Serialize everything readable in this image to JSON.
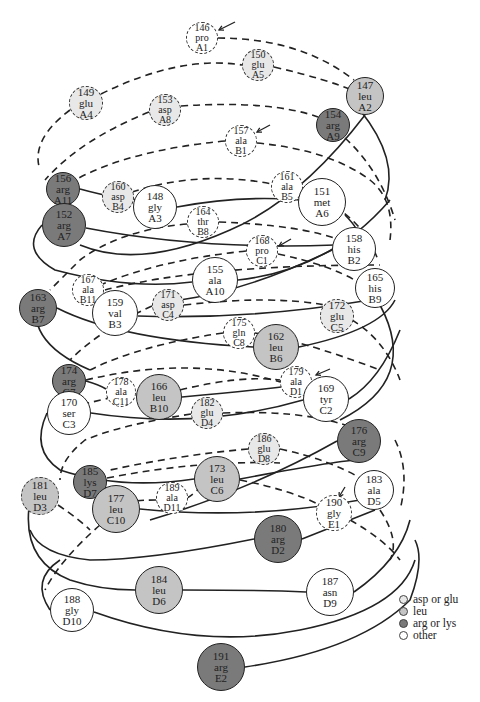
{
  "colors": {
    "asp_or_glu": "#e8e8e8",
    "leu": "#c4c4c4",
    "arg_or_lys": "#7a7a7a",
    "other": "#ffffff"
  },
  "legend": [
    {
      "label": "asp or glu",
      "category": "asp_or_glu"
    },
    {
      "label": "leu",
      "category": "leu"
    },
    {
      "label": "arg or lys",
      "category": "arg_or_lys"
    },
    {
      "label": "other",
      "category": "other"
    }
  ],
  "residues": [
    {
      "num": "146",
      "aa": "pro",
      "pos": "A1",
      "cat": "other",
      "x": 202,
      "y": 38,
      "r": 16,
      "dashed": true
    },
    {
      "num": "150",
      "aa": "glu",
      "pos": "A5",
      "cat": "asp_or_glu",
      "x": 258,
      "y": 65,
      "r": 16,
      "dashed": true
    },
    {
      "num": "147",
      "aa": "leu",
      "pos": "A2",
      "cat": "leu",
      "x": 365,
      "y": 96,
      "r": 19,
      "dashed": false
    },
    {
      "num": "149",
      "aa": "glu",
      "pos": "A4",
      "cat": "asp_or_glu",
      "x": 86,
      "y": 103,
      "r": 17,
      "dashed": true
    },
    {
      "num": "153",
      "aa": "asp",
      "pos": "A8",
      "cat": "asp_or_glu",
      "x": 165,
      "y": 110,
      "r": 16,
      "dashed": true
    },
    {
      "num": "154",
      "aa": "arg",
      "pos": "A9",
      "cat": "arg_or_lys",
      "x": 333,
      "y": 125,
      "r": 17,
      "dashed": false
    },
    {
      "num": "157",
      "aa": "ala",
      "pos": "B1",
      "cat": "other",
      "x": 241,
      "y": 141,
      "r": 16,
      "dashed": true
    },
    {
      "num": "156",
      "aa": "arg",
      "pos": "A11",
      "cat": "arg_or_lys",
      "x": 63,
      "y": 189,
      "r": 17,
      "dashed": false
    },
    {
      "num": "160",
      "aa": "asp",
      "pos": "B4",
      "cat": "asp_or_glu",
      "x": 118,
      "y": 197,
      "r": 16,
      "dashed": true
    },
    {
      "num": "148",
      "aa": "gly",
      "pos": "A3",
      "cat": "other",
      "x": 155,
      "y": 207,
      "r": 22,
      "dashed": false
    },
    {
      "num": "161",
      "aa": "ala",
      "pos": "B5",
      "cat": "other",
      "x": 287,
      "y": 187,
      "r": 16,
      "dashed": true
    },
    {
      "num": "151",
      "aa": "met",
      "pos": "A6",
      "cat": "other",
      "x": 322,
      "y": 202,
      "r": 24,
      "dashed": false
    },
    {
      "num": "152",
      "aa": "arg",
      "pos": "A7",
      "cat": "arg_or_lys",
      "x": 64,
      "y": 225,
      "r": 22,
      "dashed": false
    },
    {
      "num": "164",
      "aa": "thr",
      "pos": "B8",
      "cat": "other",
      "x": 203,
      "y": 222,
      "r": 16,
      "dashed": true
    },
    {
      "num": "168",
      "aa": "pro",
      "pos": "C1",
      "cat": "other",
      "x": 262,
      "y": 251,
      "r": 16,
      "dashed": true
    },
    {
      "num": "158",
      "aa": "his",
      "pos": "B2",
      "cat": "other",
      "x": 354,
      "y": 249,
      "r": 22,
      "dashed": false
    },
    {
      "num": "155",
      "aa": "ala",
      "pos": "A10",
      "cat": "other",
      "x": 215,
      "y": 280,
      "r": 23,
      "dashed": false
    },
    {
      "num": "165",
      "aa": "his",
      "pos": "B9",
      "cat": "other",
      "x": 375,
      "y": 288,
      "r": 20,
      "dashed": false
    },
    {
      "num": "167",
      "aa": "ala",
      "pos": "B11",
      "cat": "other",
      "x": 88,
      "y": 290,
      "r": 16,
      "dashed": true
    },
    {
      "num": "163",
      "aa": "arg",
      "pos": "B7",
      "cat": "arg_or_lys",
      "x": 38,
      "y": 308,
      "r": 19,
      "dashed": false
    },
    {
      "num": "159",
      "aa": "val",
      "pos": "B3",
      "cat": "other",
      "x": 115,
      "y": 313,
      "r": 23,
      "dashed": false
    },
    {
      "num": "171",
      "aa": "asp",
      "pos": "C4",
      "cat": "asp_or_glu",
      "x": 168,
      "y": 305,
      "r": 16,
      "dashed": true
    },
    {
      "num": "172",
      "aa": "glu",
      "pos": "C5",
      "cat": "asp_or_glu",
      "x": 337,
      "y": 316,
      "r": 17,
      "dashed": true
    },
    {
      "num": "175",
      "aa": "gln",
      "pos": "C8",
      "cat": "other",
      "x": 239,
      "y": 333,
      "r": 16,
      "dashed": true
    },
    {
      "num": "162",
      "aa": "leu",
      "pos": "B6",
      "cat": "leu",
      "x": 276,
      "y": 347,
      "r": 23,
      "dashed": false
    },
    {
      "num": "174",
      "aa": "arg",
      "pos": "C7",
      "cat": "arg_or_lys",
      "x": 69,
      "y": 381,
      "r": 17,
      "dashed": false
    },
    {
      "num": "178",
      "aa": "ala",
      "pos": "C11",
      "cat": "other",
      "x": 121,
      "y": 392,
      "r": 15,
      "dashed": true
    },
    {
      "num": "166",
      "aa": "leu",
      "pos": "B10",
      "cat": "leu",
      "x": 159,
      "y": 397,
      "r": 23,
      "dashed": false
    },
    {
      "num": "179",
      "aa": "ala",
      "pos": "D1",
      "cat": "other",
      "x": 296,
      "y": 382,
      "r": 16,
      "dashed": true
    },
    {
      "num": "170",
      "aa": "ser",
      "pos": "C3",
      "cat": "other",
      "x": 69,
      "y": 413,
      "r": 22,
      "dashed": false
    },
    {
      "num": "182",
      "aa": "glu",
      "pos": "D4",
      "cat": "asp_or_glu",
      "x": 207,
      "y": 413,
      "r": 16,
      "dashed": true
    },
    {
      "num": "169",
      "aa": "tyr",
      "pos": "C2",
      "cat": "other",
      "x": 326,
      "y": 399,
      "r": 23,
      "dashed": false
    },
    {
      "num": "176",
      "aa": "arg",
      "pos": "C9",
      "cat": "arg_or_lys",
      "x": 359,
      "y": 441,
      "r": 22,
      "dashed": false
    },
    {
      "num": "186",
      "aa": "glu",
      "pos": "D8",
      "cat": "asp_or_glu",
      "x": 264,
      "y": 449,
      "r": 16,
      "dashed": true
    },
    {
      "num": "173",
      "aa": "leu",
      "pos": "C6",
      "cat": "leu",
      "x": 217,
      "y": 479,
      "r": 23,
      "dashed": false
    },
    {
      "num": "185",
      "aa": "lys",
      "pos": "D7",
      "cat": "arg_or_lys",
      "x": 90,
      "y": 482,
      "r": 17,
      "dashed": false
    },
    {
      "num": "181",
      "aa": "leu",
      "pos": "D3",
      "cat": "leu",
      "x": 40,
      "y": 496,
      "r": 19,
      "dashed": true
    },
    {
      "num": "183",
      "aa": "ala",
      "pos": "D5",
      "cat": "other",
      "x": 374,
      "y": 490,
      "r": 20,
      "dashed": false
    },
    {
      "num": "177",
      "aa": "leu",
      "pos": "C10",
      "cat": "leu",
      "x": 116,
      "y": 509,
      "r": 24,
      "dashed": false
    },
    {
      "num": "189",
      "aa": "ala",
      "pos": "D11",
      "cat": "other",
      "x": 172,
      "y": 498,
      "r": 16,
      "dashed": true
    },
    {
      "num": "190",
      "aa": "gly",
      "pos": "E1",
      "cat": "other",
      "x": 334,
      "y": 513,
      "r": 18,
      "dashed": true
    },
    {
      "num": "180",
      "aa": "arg",
      "pos": "D2",
      "cat": "arg_or_lys",
      "x": 278,
      "y": 539,
      "r": 24,
      "dashed": false
    },
    {
      "num": "187",
      "aa": "asn",
      "pos": "D9",
      "cat": "other",
      "x": 330,
      "y": 592,
      "r": 24,
      "dashed": false
    },
    {
      "num": "184",
      "aa": "leu",
      "pos": "D6",
      "cat": "leu",
      "x": 159,
      "y": 590,
      "r": 24,
      "dashed": false
    },
    {
      "num": "188",
      "aa": "gly",
      "pos": "D10",
      "cat": "other",
      "x": 72,
      "y": 610,
      "r": 22,
      "dashed": false
    },
    {
      "num": "191",
      "aa": "arg",
      "pos": "E2",
      "cat": "arg_or_lys",
      "x": 221,
      "y": 667,
      "r": 24,
      "dashed": false
    }
  ],
  "arrows": [
    {
      "name": "arrow-a1",
      "x1": 235,
      "y1": 22,
      "x2": 219,
      "y2": 30
    },
    {
      "name": "arrow-b1",
      "x1": 270,
      "y1": 125,
      "x2": 257,
      "y2": 132
    },
    {
      "name": "arrow-c1",
      "x1": 291,
      "y1": 239,
      "x2": 279,
      "y2": 246
    },
    {
      "name": "arrow-d1",
      "x1": 330,
      "y1": 369,
      "x2": 316,
      "y2": 375
    },
    {
      "name": "arrow-e1",
      "x1": 345,
      "y1": 487,
      "x2": 339,
      "y2": 497
    }
  ]
}
